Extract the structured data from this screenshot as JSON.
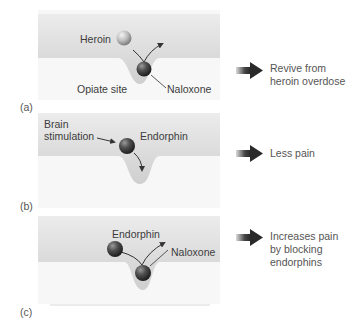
{
  "panels": [
    {
      "tag": "(a)",
      "labels": {
        "molecule_1": "Heroin",
        "site": "Opiate site",
        "molecule_2": "Naloxone"
      },
      "result": [
        "Revive from",
        "heroin overdose"
      ]
    },
    {
      "tag": "(b)",
      "labels": {
        "stimulus_line1": "Brain",
        "stimulus_line2": "stimulation",
        "molecule_1": "Endorphin"
      },
      "result": [
        "Less pain"
      ]
    },
    {
      "tag": "(c)",
      "labels": {
        "molecule_1": "Endorphin",
        "molecule_2": "Naloxone"
      },
      "result": [
        "Increases pain",
        "by blocking",
        "endorphins"
      ]
    }
  ],
  "colors": {
    "membrane": "#d2d2d2",
    "membrane_light": "#ececec",
    "background": "#ffffff",
    "ligand_dark": "#4a4a4a",
    "ligand_light": "#c8c8c8",
    "arrow": "#333333"
  }
}
